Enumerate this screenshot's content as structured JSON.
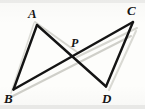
{
  "figure": {
    "kind": "geometry-diagram",
    "canvas": {
      "width": 145,
      "height": 109
    },
    "background_color": "#fdfdfb",
    "stroke_color": "#141414",
    "ghost_stroke_color": "#c9c9c4",
    "stroke_width": 2.3,
    "points": [
      {
        "id": "A",
        "label": "A",
        "x": 37.0,
        "y": 25.0,
        "label_x": 28.0,
        "label_y": 7.0
      },
      {
        "id": "B",
        "label": "B",
        "x": 13.5,
        "y": 89.5,
        "label_x": 4.5,
        "label_y": 92.0
      },
      {
        "id": "C",
        "label": "C",
        "x": 133.0,
        "y": 22.0,
        "label_x": 127.0,
        "label_y": 4.0
      },
      {
        "id": "D",
        "label": "D",
        "x": 106.0,
        "y": 86.5,
        "label_x": 103.0,
        "label_y": 92.0
      },
      {
        "id": "P",
        "label": "P",
        "x": 74.5,
        "y": 54.5,
        "label_x": 71.0,
        "label_y": 37.0
      }
    ],
    "segments": [
      {
        "id": "AB",
        "from": "A",
        "to": "B",
        "kind": "solid"
      },
      {
        "id": "AD",
        "from": "A",
        "to": "D",
        "kind": "solid",
        "through": "P"
      },
      {
        "id": "CB",
        "from": "C",
        "to": "B",
        "kind": "solid",
        "through": "P"
      },
      {
        "id": "CD",
        "from": "C",
        "to": "D",
        "kind": "solid"
      }
    ],
    "ghost_segments": [
      {
        "id": "ghost-B-C",
        "x1": 11.0,
        "y1": 97.0,
        "x2": 131.0,
        "y2": 36.0
      },
      {
        "id": "ghost-A-P",
        "x1": 35.0,
        "y1": 22.0,
        "x2": 77.0,
        "y2": 52.0
      },
      {
        "id": "ghost-P-C",
        "x1": 77.0,
        "y1": 57.0,
        "x2": 137.0,
        "y2": 28.0
      },
      {
        "id": "ghost-D-C",
        "x1": 108.0,
        "y1": 90.0,
        "x2": 136.0,
        "y2": 30.0
      }
    ]
  }
}
